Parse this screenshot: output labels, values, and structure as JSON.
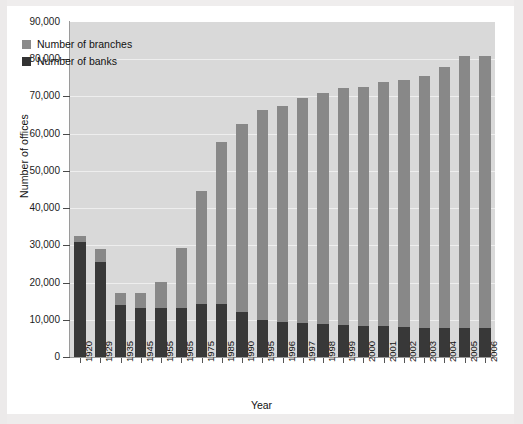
{
  "chart_data": {
    "type": "bar",
    "subtype": "stacked",
    "title": "",
    "xlabel": "Year",
    "ylabel": "Number of offices",
    "ylim": [
      0,
      90000
    ],
    "ytick_labels": [
      "90,000",
      "80,000",
      "70,000",
      "60,000",
      "50,000",
      "40,000",
      "30,000",
      "20,000",
      "10,000",
      "0"
    ],
    "ytick_values": [
      90000,
      80000,
      70000,
      60000,
      50000,
      40000,
      30000,
      20000,
      10000,
      0
    ],
    "grid": true,
    "legend_position": "upper-left",
    "categories": [
      "1920",
      "1929",
      "1935",
      "1945",
      "1955",
      "1965",
      "1975",
      "1985",
      "1990",
      "1995",
      "1996",
      "1997",
      "1998",
      "1999",
      "2000",
      "2001",
      "2002",
      "2003",
      "2004",
      "2005",
      "2006"
    ],
    "series": [
      {
        "name": "Number of banks",
        "color": "#383838",
        "values": [
          31000,
          25500,
          14100,
          13300,
          13200,
          13200,
          14300,
          14300,
          12200,
          9900,
          9500,
          9100,
          8800,
          8600,
          8400,
          8200,
          8000,
          7900,
          7900,
          7800,
          7800
        ]
      },
      {
        "name": "Number of branches",
        "color": "#888888",
        "values": [
          1600,
          3500,
          3200,
          3900,
          7000,
          16200,
          30200,
          43500,
          50300,
          56500,
          58000,
          60400,
          62200,
          63800,
          64200,
          65700,
          66400,
          67500,
          70100,
          73000,
          73200
        ]
      }
    ],
    "totals": [
      32600,
      29000,
      17300,
      17200,
      20200,
      29400,
      44500,
      57800,
      62500,
      66400,
      67500,
      69500,
      71000,
      72400,
      72600,
      73900,
      74400,
      75400,
      78000,
      80800,
      81000
    ]
  },
  "legend": {
    "items": [
      {
        "label": "Number of branches",
        "swatch": "branches"
      },
      {
        "label": "Number of banks",
        "swatch": "banks"
      }
    ]
  },
  "colors": {
    "branches": "#888888",
    "banks": "#383838",
    "plot_background": "#d9d9d9",
    "gridline": "#eeeeee",
    "axis": "#9a9a9a",
    "text": "#111111",
    "page_background": "#ffffff"
  }
}
